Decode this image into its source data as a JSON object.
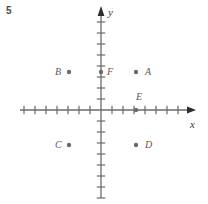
{
  "figure": {
    "problem_number": "5",
    "width": 208,
    "height": 204,
    "background_color": "#ffffff",
    "axis_color": "#6b6b6b",
    "point_color": "#6b6b6b",
    "label_color": "#5a5a5a"
  },
  "axes": {
    "x_label": "x",
    "y_label": "y",
    "origin_px": {
      "x": 101,
      "y": 110
    },
    "tick_spacing_px": 11,
    "x_axis": {
      "start_px": 20,
      "end_px": 196,
      "arrow": "right",
      "ticks_left_of_origin": 8,
      "ticks_right_of_origin": 7
    },
    "y_axis": {
      "start_px": 198,
      "end_px": 6,
      "arrow": "up",
      "ticks_above_origin": 9,
      "ticks_below_origin": 8
    }
  },
  "chart_data": {
    "type": "scatter",
    "title": "",
    "xlabel": "x",
    "ylabel": "y",
    "grid": false,
    "legend": "none",
    "xlim": [
      -8,
      8
    ],
    "ylim": [
      -8,
      9
    ],
    "points": [
      {
        "name": "A",
        "x": 3,
        "y": 3.5,
        "px": 136,
        "py": 72,
        "label_dx": 9,
        "label_dy": -5
      },
      {
        "name": "B",
        "x": -3,
        "y": 3.5,
        "px": 69,
        "py": 72,
        "label_dx": -14,
        "label_dy": -5
      },
      {
        "name": "C",
        "x": -3,
        "y": -3.2,
        "px": 69,
        "py": 145,
        "label_dx": -14,
        "label_dy": -5
      },
      {
        "name": "D",
        "x": 3,
        "y": -3.2,
        "px": 136,
        "py": 145,
        "label_dx": 9,
        "label_dy": -5
      },
      {
        "name": "E",
        "x": 3,
        "y": 0,
        "px": 136,
        "py": 110,
        "label_dx": 0,
        "label_dy": -18
      },
      {
        "name": "F",
        "x": 0,
        "y": 3.5,
        "px": 101,
        "py": 72,
        "label_dx": 6,
        "label_dy": -5
      }
    ]
  }
}
